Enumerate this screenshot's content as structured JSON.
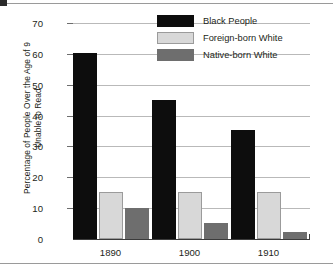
{
  "chart_data": {
    "type": "bar",
    "title": "",
    "xlabel": "",
    "ylabel": "Percentage of People Over the Age of 9 Unable to Read",
    "ylabel_line1": "Percentage of People Over the Age of 9",
    "ylabel_line2": "Unable to Read",
    "categories": [
      "1890",
      "1900",
      "1910"
    ],
    "series": [
      {
        "name": "Black People",
        "color": "#0d0d0d",
        "values": [
          60.3,
          45.2,
          35.3
        ]
      },
      {
        "name": "Foreign-born White",
        "color": "#d8d8d8",
        "values": [
          15.2,
          15.2,
          15.2
        ]
      },
      {
        "name": "Native-born White",
        "color": "#6e6e6e",
        "values": [
          10.2,
          5.3,
          2.2
        ]
      }
    ],
    "ylim": [
      0,
      70
    ],
    "yticks": [
      0,
      10,
      20,
      30,
      40,
      50,
      60,
      70
    ],
    "ytick_labels": [
      "0",
      "10",
      "20",
      "30",
      "40",
      "50",
      "60",
      "70"
    ],
    "grid": true,
    "legend_position": "top-right"
  },
  "legend": {
    "entries": [
      {
        "label": "Black People"
      },
      {
        "label": "Foreign-born White"
      },
      {
        "label": "Native-born White"
      }
    ]
  }
}
